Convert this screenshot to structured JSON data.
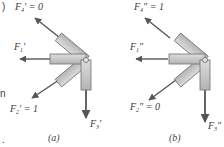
{
  "figures": [
    {
      "caption": "(a)",
      "labels": {
        "F4": {
          "name": "F",
          "sub": "4",
          "prime": "′",
          "eq": " = 0"
        },
        "F1": {
          "name": "F",
          "sub": "1",
          "prime": "′",
          "eq": ""
        },
        "F2": {
          "name": "F",
          "sub": "2",
          "prime": "′",
          "eq": " = 1"
        },
        "F3": {
          "name": "F",
          "sub": "3",
          "prime": "′",
          "eq": ""
        }
      }
    },
    {
      "caption": "(b)",
      "labels": {
        "F4": {
          "name": "F",
          "sub": "4",
          "prime": "″",
          "eq": " = 1"
        },
        "F1": {
          "name": "F",
          "sub": "1",
          "prime": "″",
          "eq": ""
        },
        "F2": {
          "name": "F",
          "sub": "2",
          "prime": "″",
          "eq": " = 0"
        },
        "F3": {
          "name": "F",
          "sub": "3",
          "prime": "″",
          "eq": ""
        }
      }
    }
  ],
  "edge_fragments": {
    "top": ")",
    "middle": "n",
    "bottom": "."
  },
  "colors": {
    "member_fill": "#c8c8c8",
    "member_stroke": "#6e6e6e",
    "arrow": "#555555",
    "joint": "#e0e0e0"
  }
}
